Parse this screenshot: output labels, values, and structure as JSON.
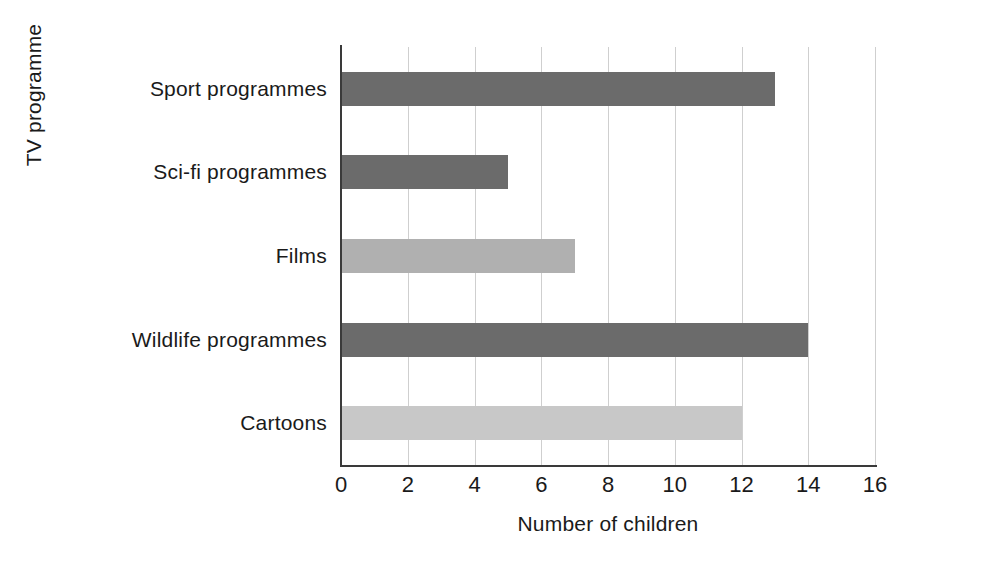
{
  "chart_data": {
    "type": "bar",
    "orientation": "horizontal",
    "title": "",
    "xlabel": "Number of children",
    "ylabel": "TV programme",
    "categories": [
      "Sport programmes",
      "Sci-fi programmes",
      "Films",
      "Wildlife programmes",
      "Cartoons"
    ],
    "values": [
      13,
      5,
      7,
      14,
      12
    ],
    "bar_colors": [
      "#6b6b6b",
      "#6b6b6b",
      "#b0b0b0",
      "#6b6b6b",
      "#c8c8c8"
    ],
    "xlim": [
      0,
      16
    ],
    "xticks": [
      0,
      2,
      4,
      6,
      8,
      10,
      12,
      14,
      16
    ],
    "xtick_labels": [
      "0",
      "2",
      "4",
      "6",
      "8",
      "10",
      "12",
      "14",
      "16"
    ],
    "grid": "vertical",
    "legend": "none"
  },
  "style": {
    "background": "#ffffff",
    "gridline_color": "#cfcfcf",
    "axis_color": "#3a3a3a",
    "text_color": "#1a1a1a"
  }
}
